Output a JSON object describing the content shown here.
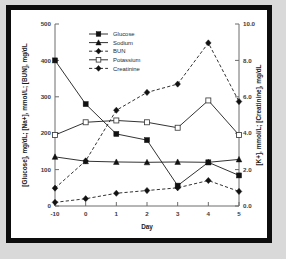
{
  "figure": {
    "background_color": "#d9d9d9",
    "frame_color": "#0d0d0d",
    "plot_background": "#ffffff"
  },
  "chart_data": {
    "type": "line",
    "title": "",
    "xlabel": "Day",
    "ylabel": "[Glucose], mg/dL; [Na+], mmol/L; [BUN], mg/dL",
    "y2label": "[K+], mmol/L; [Creatinine], mg/dL",
    "x": [
      -10,
      0,
      1,
      2,
      3,
      4,
      5
    ],
    "xtick_labels": [
      "-10",
      "0",
      "1",
      "2",
      "3",
      "4",
      "5"
    ],
    "ylim": [
      0,
      500
    ],
    "ytick_labels": [
      "0",
      "100",
      "200",
      "300",
      "400",
      "500"
    ],
    "ytick_values": [
      0,
      100,
      200,
      300,
      400,
      500
    ],
    "y2lim": [
      0.0,
      10.0
    ],
    "y2tick_labels": [
      "0.0",
      "2.0",
      "4.0",
      "6.0",
      "8.0",
      "10.0"
    ],
    "y2tick_values": [
      0,
      2,
      4,
      6,
      8,
      10
    ],
    "grid": false,
    "legend_position": "top-center",
    "series": [
      {
        "name": "Glucose",
        "axis": "left",
        "marker": "filled-square",
        "linestyle": "solid",
        "values": [
          400,
          280,
          198,
          181,
          56,
          120,
          84
        ]
      },
      {
        "name": "Sodium",
        "axis": "left",
        "marker": "filled-triangle",
        "linestyle": "solid",
        "values": [
          135,
          123,
          121,
          120,
          121,
          120,
          128
        ]
      },
      {
        "name": "BUN",
        "axis": "left",
        "marker": "filled-diamond",
        "linestyle": "dashed",
        "values": [
          49,
          124,
          263,
          312,
          335,
          448,
          287
        ]
      },
      {
        "name": "Potassium",
        "axis": "right",
        "marker": "open-square",
        "linestyle": "solid",
        "values": [
          3.9,
          4.6,
          4.7,
          4.6,
          4.3,
          5.8,
          3.9
        ]
      },
      {
        "name": "Creatinine",
        "axis": "right",
        "marker": "filled-diamond",
        "linestyle": "dashed",
        "values": [
          0.2,
          0.4,
          0.7,
          0.85,
          1.0,
          1.4,
          0.8
        ]
      }
    ]
  }
}
